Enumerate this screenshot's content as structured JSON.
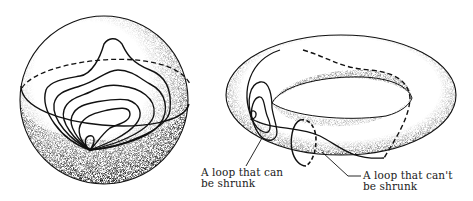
{
  "figure": {
    "panels": [
      {
        "name": "sphere",
        "loops_drawn": 6,
        "shading": "stippled lower hemisphere",
        "equator": "dashed back half, solid front half"
      },
      {
        "name": "torus",
        "loops": [
          "contractible loop",
          "non-contractible loop around tube",
          "non-contractible loop around hole"
        ]
      }
    ],
    "labels": {
      "shrinkable": {
        "line1": "A loop that can",
        "line2": "be shrunk"
      },
      "unshrinkable": {
        "line1": "A loop that can't",
        "line2": "be shrunk"
      }
    },
    "colors": {
      "ink": "#111111",
      "stipple": "#555555",
      "background": "#ffffff"
    }
  }
}
